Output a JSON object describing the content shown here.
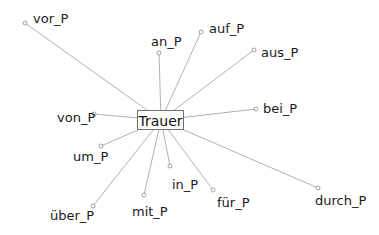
{
  "center": {
    "label": "Trauer",
    "x": 161,
    "y": 120
  },
  "nodes": [
    {
      "id": "vor",
      "label": "vor_P",
      "x": 25,
      "y": 23,
      "lx": 33,
      "ly": 12
    },
    {
      "id": "an",
      "label": "an_P",
      "x": 159,
      "y": 53,
      "lx": 151,
      "ly": 35
    },
    {
      "id": "auf",
      "label": "auf_P",
      "x": 201,
      "y": 32,
      "lx": 209,
      "ly": 22
    },
    {
      "id": "aus",
      "label": "aus_P",
      "x": 254,
      "y": 50,
      "lx": 261,
      "ly": 46
    },
    {
      "id": "bei",
      "label": "bei_P",
      "x": 256,
      "y": 109,
      "lx": 263,
      "ly": 102
    },
    {
      "id": "von",
      "label": "von_P",
      "x": 94,
      "y": 114,
      "lx": 57,
      "ly": 111
    },
    {
      "id": "um",
      "label": "um_P",
      "x": 101,
      "y": 146,
      "lx": 73,
      "ly": 150
    },
    {
      "id": "ueber",
      "label": "über_P",
      "x": 93,
      "y": 206,
      "lx": 50,
      "ly": 209
    },
    {
      "id": "mit",
      "label": "mit_P",
      "x": 144,
      "y": 195,
      "lx": 132,
      "ly": 205
    },
    {
      "id": "in",
      "label": "in_P",
      "x": 170,
      "y": 166,
      "lx": 172,
      "ly": 178
    },
    {
      "id": "fuer",
      "label": "für_P",
      "x": 213,
      "y": 190,
      "lx": 217,
      "ly": 196
    },
    {
      "id": "durch",
      "label": "durch_P",
      "x": 318,
      "y": 188,
      "lx": 315,
      "ly": 194
    }
  ]
}
